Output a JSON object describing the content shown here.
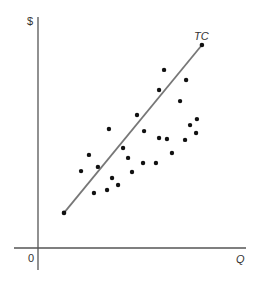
{
  "chart_data": {
    "type": "scatter",
    "title": "",
    "xlabel": "Q",
    "ylabel": "$",
    "origin_label": "0",
    "grid": false,
    "legend": null,
    "xlim": [
      0,
      100
    ],
    "ylim": [
      0,
      100
    ],
    "axis_ticks": "none (unlabeled axes)",
    "series": [
      {
        "name": "observations",
        "kind": "scatter",
        "points": [
          [
            20.7,
            33.3
          ],
          [
            24.5,
            40.3
          ],
          [
            26.9,
            23.8
          ],
          [
            28.8,
            35.1
          ],
          [
            33.2,
            25.1
          ],
          [
            34.1,
            51.5
          ],
          [
            35.6,
            30.3
          ],
          [
            38.5,
            27.3
          ],
          [
            40.9,
            43.3
          ],
          [
            43.3,
            39.0
          ],
          [
            45.2,
            32.9
          ],
          [
            47.6,
            57.6
          ],
          [
            50.5,
            36.8
          ],
          [
            51.0,
            50.6
          ],
          [
            56.7,
            36.8
          ],
          [
            58.2,
            47.6
          ],
          [
            58.2,
            68.4
          ],
          [
            60.6,
            77.1
          ],
          [
            62.0,
            47.2
          ],
          [
            64.4,
            41.1
          ],
          [
            68.3,
            63.6
          ],
          [
            70.7,
            46.8
          ],
          [
            71.2,
            72.7
          ],
          [
            73.1,
            53.2
          ],
          [
            76.0,
            49.8
          ],
          [
            76.4,
            55.8
          ]
        ]
      },
      {
        "name": "TC",
        "kind": "line",
        "label": "TC",
        "points": [
          [
            12.5,
            15.2
          ],
          [
            78.8,
            87.9
          ]
        ],
        "endpoint_markers": true
      }
    ],
    "annotations": [
      {
        "text": "TC",
        "at": [
          78.8,
          87.9
        ],
        "position": "above endpoint"
      }
    ]
  },
  "colors": {
    "axis": "#555555",
    "line": "#777777",
    "dot": "#111111",
    "text": "#333333"
  }
}
